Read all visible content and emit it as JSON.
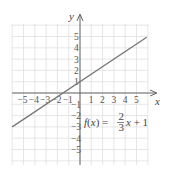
{
  "chart_data": {
    "type": "line",
    "title": "",
    "xlabel": "x",
    "ylabel": "y",
    "xlim": [
      -6,
      6
    ],
    "ylim": [
      -6,
      6
    ],
    "grid": true,
    "x_ticks": [
      "-5",
      "-4",
      "-3",
      "-2",
      "-1",
      "1",
      "2",
      "3",
      "4",
      "5"
    ],
    "y_ticks": [
      "5",
      "4",
      "3",
      "2",
      "1",
      "-1",
      "-2",
      "-3",
      "-4",
      "-5"
    ],
    "series": [
      {
        "name": "f(x) = 2/3 x + 1",
        "equation": "f(x) = (2/3)x + 1",
        "slope": 0.6667,
        "intercept": 1,
        "x": [
          -6,
          5.9
        ],
        "y": [
          -3,
          4.93
        ]
      }
    ],
    "annotation": {
      "prefix": "f(x) = ",
      "numerator": "2",
      "denominator": "3",
      "suffix": "x + 1"
    },
    "colors": {
      "line": "#777777",
      "grid": "#dddddd",
      "axis": "#666666"
    }
  }
}
